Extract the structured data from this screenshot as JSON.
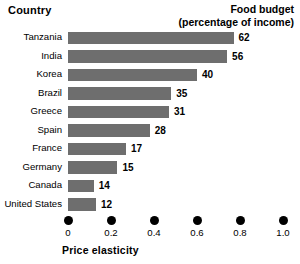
{
  "header": {
    "country_label": "Country",
    "budget_label_line1": "Food budget",
    "budget_label_line2": "(percentage of income)"
  },
  "axis": {
    "title": "Price elasticity",
    "tick_labels": [
      "0",
      "0.2",
      "0.4",
      "0.6",
      "0.8",
      "1.0"
    ],
    "tick_values": [
      0,
      0.2,
      0.4,
      0.6,
      0.8,
      1.0
    ],
    "tick_marker": "dot"
  },
  "colors": {
    "bar": "#6e6e6e",
    "text": "#000000",
    "background": "#ffffff",
    "tick_dot": "#000000"
  },
  "chart_data": {
    "type": "bar",
    "orientation": "horizontal",
    "title": "",
    "subtitle": "",
    "xlabel": "Price elasticity",
    "ylabel": "Country",
    "xlim": [
      0,
      1.0
    ],
    "grid": false,
    "legend": "none",
    "value_label_header": "Food budget (percentage of income)",
    "categories": [
      "Tanzania",
      "India",
      "Korea",
      "Brazil",
      "Greece",
      "Spain",
      "France",
      "Germany",
      "Canada",
      "United States"
    ],
    "series": [
      {
        "name": "Price elasticity",
        "values": [
          0.77,
          0.74,
          0.6,
          0.48,
          0.47,
          0.38,
          0.27,
          0.23,
          0.12,
          0.13
        ]
      },
      {
        "name": "Food budget (percentage of income)",
        "values": [
          62,
          56,
          40,
          35,
          31,
          28,
          17,
          15,
          14,
          12
        ]
      }
    ],
    "data_labels": [
      "62",
      "56",
      "40",
      "35",
      "31",
      "28",
      "17",
      "15",
      "14",
      "12"
    ],
    "annotations": []
  }
}
